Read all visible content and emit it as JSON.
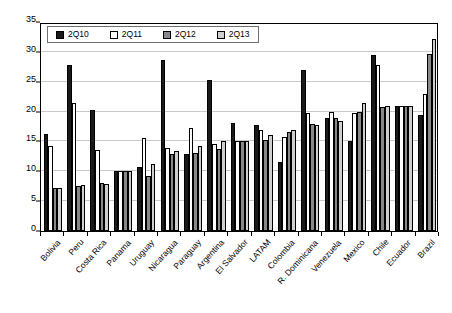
{
  "chart_data": {
    "type": "bar",
    "title": "",
    "subtitle": "",
    "xlabel": "",
    "ylabel": "",
    "ylim": [
      0,
      35
    ],
    "yticks": [
      0,
      5,
      10,
      15,
      20,
      25,
      30,
      35
    ],
    "grid": true,
    "legend_position": "top-left",
    "categories": [
      "Bolivia",
      "Peru",
      "Costa Rica",
      "Panama",
      "Uruguay",
      "Nicaragua",
      "Paraguay",
      "Argentina",
      "El Salvador",
      "LATAM",
      "Colombia",
      "R. Dominicana",
      "Venezuela",
      "Mexico",
      "Chile",
      "Ecuador",
      "Brazil"
    ],
    "series": [
      {
        "name": "2Q10",
        "color": "#1a1a1a",
        "values": [
          16.2,
          27.8,
          20.3,
          10.0,
          10.8,
          28.7,
          12.9,
          25.3,
          18.1,
          17.8,
          11.5,
          27.0,
          19.0,
          15.0,
          29.5,
          21.0,
          19.5
        ]
      },
      {
        "name": "2Q11",
        "color": "#fdfdfd",
        "values": [
          14.2,
          21.4,
          13.6,
          10.0,
          15.5,
          13.9,
          17.3,
          14.6,
          15.0,
          17.0,
          15.8,
          19.8,
          20.0,
          19.8,
          27.8,
          21.0,
          23.0
        ]
      },
      {
        "name": "2Q12",
        "color": "#888888",
        "values": [
          7.2,
          7.5,
          8.0,
          10.0,
          9.2,
          12.9,
          13.0,
          13.8,
          15.0,
          15.2,
          16.5,
          18.0,
          19.0,
          20.0,
          20.7,
          21.0,
          29.7
        ]
      },
      {
        "name": "2Q13",
        "color": "#cfcfcf",
        "values": [
          7.2,
          7.7,
          7.9,
          10.0,
          11.3,
          13.4,
          14.3,
          15.0,
          15.0,
          16.0,
          17.0,
          17.7,
          18.5,
          21.5,
          21.0,
          21.0,
          32.2
        ]
      }
    ]
  }
}
